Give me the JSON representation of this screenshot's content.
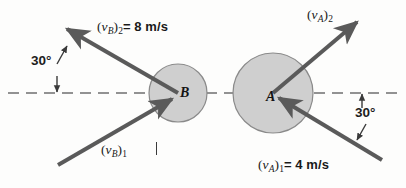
{
  "figure": {
    "background_color": "#fdfdfc",
    "line_color": "#5a5a5a",
    "circle_fill": "#cfcfcf",
    "circle_stroke": "#8a8a8a",
    "text_color": "#1a1a1a"
  },
  "bodies": [
    {
      "id": "B",
      "label": "B",
      "center_x": 178,
      "center_y": 93,
      "radius": 29
    },
    {
      "id": "A",
      "label": "A",
      "center_x": 273,
      "center_y": 93,
      "radius": 40
    }
  ],
  "line_of_impact": {
    "name": "line-of-impact",
    "style": "dashed",
    "y": 93,
    "x_start": 8,
    "x_end": 400
  },
  "vectors": [
    {
      "id": "vB2",
      "label_open": "(",
      "label_v": "v",
      "label_body": "B",
      "label_close": ")",
      "label_index": "2",
      "equals": "=",
      "magnitude": "8 m/s",
      "full_text": "(vB)2 = 8 m/s",
      "angle_deg": 30,
      "direction": "outgoing",
      "from_x": 178,
      "from_y": 93,
      "to_x": 62,
      "to_y": 26
    },
    {
      "id": "vA2",
      "label_open": "(",
      "label_v": "v",
      "label_body": "A",
      "label_close": ")",
      "label_index": "2",
      "equals": "",
      "magnitude": "",
      "full_text": "(vA)2",
      "angle_deg": 30,
      "direction": "outgoing",
      "from_x": 273,
      "from_y": 93,
      "to_x": 362,
      "to_y": 18
    },
    {
      "id": "vB1",
      "label_open": "(",
      "label_v": "v",
      "label_body": "B",
      "label_close": ")",
      "label_index": "1",
      "equals": "",
      "magnitude": "",
      "full_text": "(vB)1",
      "direction": "incoming",
      "from_x": 58,
      "from_y": 165,
      "to_x": 178,
      "to_y": 93
    },
    {
      "id": "vA1",
      "label_open": "(",
      "label_v": "v",
      "label_body": "A",
      "label_close": ")",
      "label_index": "1",
      "equals": "=",
      "magnitude": "4 m/s",
      "full_text": "(vA)1 = 4 m/s",
      "angle_deg": 30,
      "direction": "incoming",
      "from_x": 382,
      "from_y": 160,
      "to_x": 273,
      "to_y": 93
    }
  ],
  "angles": [
    {
      "id": "angle-left",
      "value": "30°",
      "between": "vB2-and-line-of-impact",
      "x": 31,
      "y": 54
    },
    {
      "id": "angle-right",
      "value": "30°",
      "between": "vA1-and-line-of-impact",
      "x": 355,
      "y": 106
    }
  ],
  "caret": {
    "visible": true,
    "after": "vB1"
  }
}
